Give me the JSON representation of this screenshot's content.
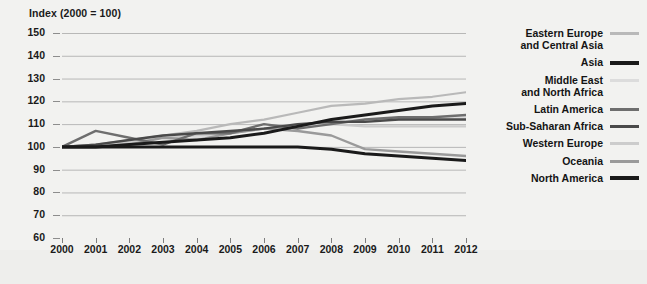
{
  "axis_title": "Index (2000 = 100)",
  "legend": {
    "items": [
      {
        "label": "Eastern Europe\nand Central Asia",
        "color": "#b9b9b9",
        "weight": "thin"
      },
      {
        "label": "Asia",
        "color": "#1a1a1a",
        "weight": "thick"
      },
      {
        "label": "Middle East\nand North Africa",
        "color": "#dcdcdc",
        "weight": "thin"
      },
      {
        "label": "Latin America",
        "color": "#6e6e6e",
        "weight": "thin"
      },
      {
        "label": "Sub-Saharan Africa",
        "color": "#4a4a4a",
        "weight": "thin"
      },
      {
        "label": "Western Europe",
        "color": "#cccccc",
        "weight": "thin"
      },
      {
        "label": "Oceania",
        "color": "#9a9a9a",
        "weight": "thin"
      },
      {
        "label": "North America",
        "color": "#1a1a1a",
        "weight": "thick"
      }
    ]
  },
  "chart_data": {
    "type": "line",
    "title": "Index (2000 = 100)",
    "xlabel": "",
    "ylabel": "Index (2000 = 100)",
    "x": [
      2000,
      2001,
      2002,
      2003,
      2004,
      2005,
      2006,
      2007,
      2008,
      2009,
      2010,
      2011,
      2012
    ],
    "xlim": [
      2000,
      2012
    ],
    "ylim": [
      60,
      150
    ],
    "yticks": [
      60,
      70,
      80,
      90,
      100,
      110,
      120,
      130,
      140,
      150
    ],
    "grid": true,
    "legend_position": "right",
    "series": [
      {
        "name": "Eastern Europe and Central Asia",
        "color": "#b9b9b9",
        "width": 2.2,
        "values": [
          100,
          101,
          103,
          105,
          107,
          110,
          112,
          115,
          118,
          119,
          121,
          122,
          124
        ]
      },
      {
        "name": "Asia",
        "color": "#1a1a1a",
        "width": 3.0,
        "values": [
          100,
          100,
          101,
          102,
          103,
          104,
          106,
          109,
          112,
          114,
          116,
          118,
          119
        ]
      },
      {
        "name": "Middle East and North Africa",
        "color": "#dcdcdc",
        "width": 2.2,
        "values": [
          100,
          100,
          101,
          102,
          104,
          106,
          108,
          110,
          111,
          112,
          112,
          113,
          113
        ]
      },
      {
        "name": "Latin America",
        "color": "#6e6e6e",
        "width": 2.4,
        "values": [
          100,
          107,
          104,
          101,
          106,
          106,
          110,
          108,
          110,
          112,
          113,
          113,
          114
        ]
      },
      {
        "name": "Sub-Saharan Africa",
        "color": "#4a4a4a",
        "width": 2.4,
        "values": [
          100,
          101,
          103,
          105,
          106,
          107,
          108,
          110,
          111,
          111,
          112,
          112,
          112
        ]
      },
      {
        "name": "Western Europe",
        "color": "#cccccc",
        "width": 2.2,
        "values": [
          100,
          101,
          102,
          104,
          105,
          106,
          108,
          109,
          110,
          109,
          109,
          109,
          109
        ]
      },
      {
        "name": "Oceania",
        "color": "#9a9a9a",
        "width": 2.4,
        "values": [
          100,
          100,
          101,
          104,
          103,
          106,
          108,
          107,
          105,
          99,
          98,
          97,
          96
        ]
      },
      {
        "name": "North America",
        "color": "#1a1a1a",
        "width": 3.0,
        "values": [
          100,
          100,
          100,
          100,
          100,
          100,
          100,
          100,
          99,
          97,
          96,
          95,
          94
        ]
      }
    ]
  }
}
